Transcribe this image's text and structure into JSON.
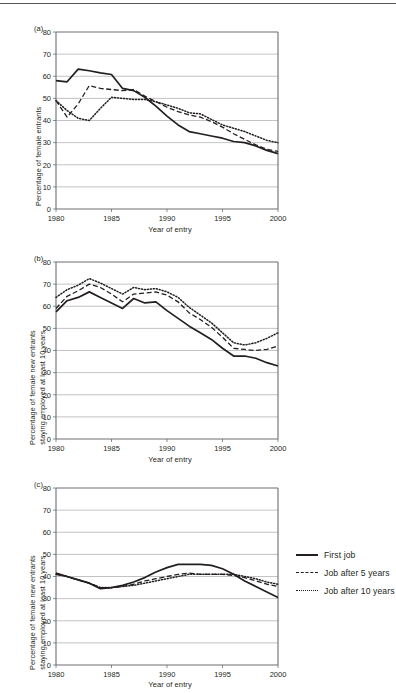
{
  "figure": {
    "panels": [
      {
        "id": "a",
        "label": "(a)",
        "xlabel": "Year of entry",
        "ylabel_lines": [
          "Percentage of female entrants"
        ]
      },
      {
        "id": "b",
        "label": "(b)",
        "xlabel": "Year of entry",
        "ylabel_lines": [
          "Percentage of female new entrants",
          "staying employed at least 10 years"
        ]
      },
      {
        "id": "c",
        "label": "(c)",
        "xlabel": "Year of entry",
        "ylabel_lines": [
          "Percentage of female new entrants",
          "staying employed at least 10 years"
        ]
      }
    ],
    "legend": {
      "position": "right-of-panel-c",
      "entries": [
        {
          "label": "First job",
          "style": "solid"
        },
        {
          "label": "Job after 5 years",
          "style": "dashed"
        },
        {
          "label": "Job after 10 years",
          "style": "dotted"
        }
      ]
    },
    "colors": {
      "line": "#231f20",
      "grid": "#a7a9ac",
      "axis": "#6d6e71",
      "background": "#ffffff"
    }
  },
  "chart_data": [
    {
      "type": "line",
      "panel": "a",
      "title": "",
      "xlabel": "Year of entry",
      "ylabel": "Percentage of female entrants",
      "xlim": [
        1980,
        2000
      ],
      "ylim": [
        0,
        80
      ],
      "yticks": [
        0,
        10,
        20,
        30,
        40,
        50,
        60,
        70,
        80
      ],
      "xticks": [
        1980,
        1985,
        1990,
        1995,
        2000
      ],
      "grid": true,
      "legend_position": "external",
      "x": [
        1980,
        1981,
        1982,
        1983,
        1984,
        1985,
        1986,
        1987,
        1988,
        1989,
        1990,
        1991,
        1992,
        1993,
        1994,
        1995,
        1996,
        1997,
        1998,
        1999,
        2000
      ],
      "series": [
        {
          "name": "First job",
          "style": "solid",
          "values": [
            58.0,
            57.5,
            63.2,
            62.5,
            61.5,
            60.8,
            54.5,
            53.5,
            50.5,
            46.5,
            42.0,
            38.0,
            35.0,
            34.0,
            33.0,
            32.0,
            30.5,
            30.0,
            28.5,
            26.5,
            25.0
          ]
        },
        {
          "name": "Job after 5 years",
          "style": "dashed",
          "values": [
            49.0,
            41.5,
            47.5,
            55.8,
            54.5,
            54.0,
            53.5,
            54.0,
            51.0,
            48.5,
            46.0,
            44.0,
            42.5,
            41.5,
            39.5,
            37.0,
            34.0,
            31.5,
            29.0,
            27.0,
            26.0
          ]
        },
        {
          "name": "Job after 10 years",
          "style": "dotted",
          "values": [
            49.0,
            44.5,
            41.0,
            40.0,
            45.5,
            50.5,
            50.0,
            49.5,
            49.5,
            48.5,
            47.0,
            45.5,
            43.5,
            43.0,
            40.5,
            38.0,
            36.5,
            35.0,
            33.0,
            31.0,
            30.0
          ]
        }
      ]
    },
    {
      "type": "line",
      "panel": "b",
      "title": "",
      "xlabel": "Year of entry",
      "ylabel": "Percentage of female new entrants staying employed at least 10 years",
      "xlim": [
        1980,
        2000
      ],
      "ylim": [
        0,
        80
      ],
      "yticks": [
        0,
        10,
        20,
        30,
        40,
        50,
        60,
        70,
        80
      ],
      "xticks": [
        1980,
        1985,
        1990,
        1995,
        2000
      ],
      "grid": true,
      "legend_position": "external",
      "x": [
        1980,
        1981,
        1982,
        1983,
        1984,
        1985,
        1986,
        1987,
        1988,
        1989,
        1990,
        1991,
        1992,
        1993,
        1994,
        1995,
        1996,
        1997,
        1998,
        1999,
        2000
      ],
      "series": [
        {
          "name": "First job",
          "style": "solid",
          "values": [
            57.5,
            62.5,
            64.0,
            66.5,
            64.0,
            61.5,
            59.0,
            63.5,
            61.5,
            62.0,
            58.0,
            54.5,
            51.0,
            48.0,
            45.0,
            41.0,
            37.5,
            37.5,
            36.5,
            34.5,
            33.0
          ]
        },
        {
          "name": "Job after 5 years",
          "style": "dashed",
          "values": [
            59.0,
            64.5,
            67.0,
            70.0,
            68.5,
            65.5,
            62.0,
            65.5,
            66.0,
            66.5,
            65.0,
            62.0,
            57.0,
            54.0,
            50.5,
            46.0,
            41.0,
            40.5,
            40.0,
            40.5,
            42.0
          ]
        },
        {
          "name": "Job after 10 years",
          "style": "dotted",
          "values": [
            64.0,
            67.5,
            69.5,
            72.5,
            70.5,
            68.0,
            65.5,
            68.5,
            67.5,
            68.0,
            66.5,
            64.0,
            59.5,
            56.0,
            52.5,
            48.0,
            43.5,
            42.5,
            43.5,
            45.5,
            48.0
          ]
        }
      ]
    },
    {
      "type": "line",
      "panel": "c",
      "title": "",
      "xlabel": "Year of entry",
      "ylabel": "Percentage of female new entrants staying employed at least 10 years",
      "xlim": [
        1980,
        2000
      ],
      "ylim": [
        0,
        80
      ],
      "yticks": [
        0,
        10,
        20,
        30,
        40,
        50,
        60,
        70,
        80
      ],
      "xticks": [
        1980,
        1985,
        1990,
        1995,
        2000
      ],
      "grid": true,
      "legend_position": "external",
      "x": [
        1980,
        1981,
        1982,
        1983,
        1984,
        1985,
        1986,
        1987,
        1988,
        1989,
        1990,
        1991,
        1992,
        1993,
        1994,
        1995,
        1996,
        1997,
        1998,
        1999,
        2000
      ],
      "series": [
        {
          "name": "First job",
          "style": "solid",
          "values": [
            41.5,
            40.0,
            38.5,
            37.0,
            34.5,
            35.0,
            36.0,
            37.5,
            39.5,
            42.0,
            44.0,
            45.5,
            45.5,
            45.5,
            45.0,
            43.5,
            41.0,
            38.0,
            35.5,
            33.0,
            30.5
          ]
        },
        {
          "name": "Job after 5 years",
          "style": "dashed",
          "values": [
            41.0,
            40.0,
            38.5,
            37.0,
            35.0,
            35.0,
            35.5,
            36.5,
            38.0,
            39.0,
            40.0,
            41.0,
            41.5,
            41.0,
            41.0,
            41.0,
            40.5,
            39.5,
            38.0,
            36.5,
            35.5
          ]
        },
        {
          "name": "Job after 10 years",
          "style": "dotted",
          "values": [
            41.0,
            40.0,
            38.5,
            37.0,
            35.0,
            35.0,
            35.5,
            36.0,
            37.0,
            38.0,
            39.0,
            40.0,
            41.0,
            41.0,
            41.0,
            41.0,
            41.0,
            40.0,
            39.0,
            37.5,
            36.5
          ]
        }
      ]
    }
  ]
}
